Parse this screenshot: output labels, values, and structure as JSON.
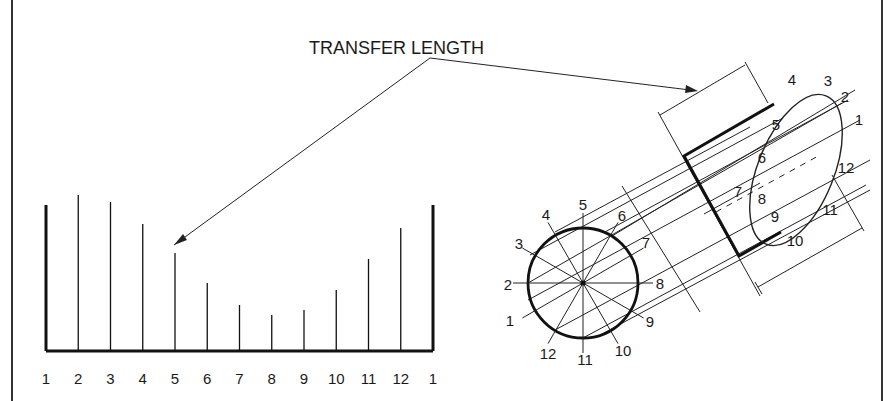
{
  "diagram": {
    "title": "TRANSFER LENGTH",
    "colors": {
      "ink": "#1a1a1a",
      "background": "#ffffff"
    },
    "development": {
      "baseline_y": 351,
      "x_start": 46,
      "x_end": 433,
      "labels": [
        "1",
        "2",
        "3",
        "4",
        "5",
        "6",
        "7",
        "8",
        "9",
        "10",
        "11",
        "12",
        "1"
      ],
      "element_top_y": [
        205,
        195,
        202,
        224,
        253,
        283,
        305,
        315,
        310,
        290,
        259,
        228,
        205
      ]
    },
    "circle_view": {
      "center": [
        583,
        283
      ],
      "radius": 55,
      "labels": [
        "1",
        "2",
        "3",
        "4",
        "5",
        "6",
        "7",
        "8",
        "9",
        "10",
        "11",
        "12"
      ]
    },
    "ellipse_view": {
      "labels": [
        "1",
        "2",
        "3",
        "4",
        "5",
        "6",
        "7",
        "8",
        "9",
        "10",
        "11",
        "12"
      ]
    }
  }
}
